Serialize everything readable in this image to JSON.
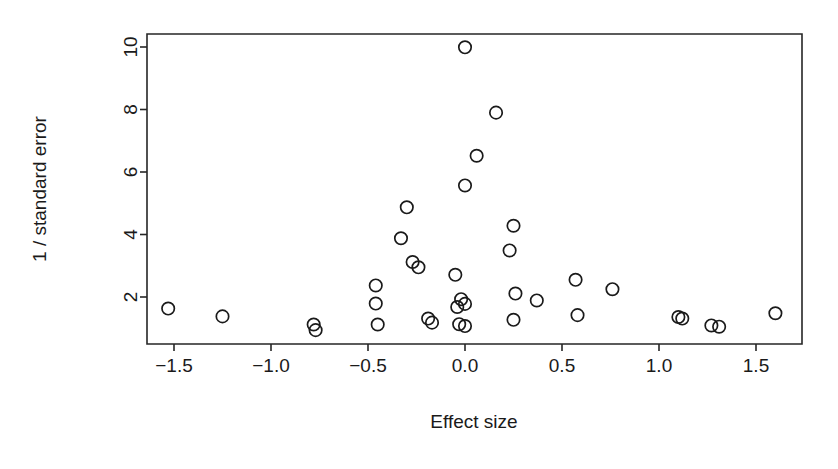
{
  "chart_data": {
    "type": "scatter",
    "title": "",
    "subtitle": "",
    "xlabel": "Effect size",
    "ylabel": "1 / standard error",
    "xlim": [
      -1.73,
      1.83
    ],
    "ylim": [
      0.72,
      10.55
    ],
    "grid": false,
    "legend": null,
    "xticks": [
      -1.5,
      -1.0,
      -0.5,
      0.0,
      0.5,
      1.0,
      1.5
    ],
    "xticklabels": [
      "-1.5",
      "-1.0",
      "-0.5",
      "0.0",
      "0.5",
      "1.0",
      "1.5"
    ],
    "yticks": [
      2,
      4,
      6,
      8,
      10
    ],
    "yticklabels": [
      "2",
      "4",
      "6",
      "8",
      "10"
    ],
    "marker": "open-circle",
    "marker_radius_px": 6.2,
    "point_color": "#1a1a1a",
    "points": [
      {
        "x": -1.53,
        "y": 1.63
      },
      {
        "x": -1.25,
        "y": 1.38
      },
      {
        "x": -0.78,
        "y": 1.12
      },
      {
        "x": -0.77,
        "y": 0.94
      },
      {
        "x": -0.46,
        "y": 2.37
      },
      {
        "x": -0.46,
        "y": 1.79
      },
      {
        "x": -0.45,
        "y": 1.12
      },
      {
        "x": -0.3,
        "y": 4.87
      },
      {
        "x": -0.33,
        "y": 3.88
      },
      {
        "x": -0.27,
        "y": 3.12
      },
      {
        "x": -0.24,
        "y": 2.95
      },
      {
        "x": -0.19,
        "y": 1.31
      },
      {
        "x": -0.17,
        "y": 1.18
      },
      {
        "x": -0.05,
        "y": 2.71
      },
      {
        "x": -0.02,
        "y": 1.93
      },
      {
        "x": -0.04,
        "y": 1.68
      },
      {
        "x": 0.0,
        "y": 1.78
      },
      {
        "x": -0.03,
        "y": 1.13
      },
      {
        "x": 0.0,
        "y": 1.07
      },
      {
        "x": 0.0,
        "y": 9.99
      },
      {
        "x": 0.16,
        "y": 7.9
      },
      {
        "x": 0.06,
        "y": 6.52
      },
      {
        "x": 0.0,
        "y": 5.57
      },
      {
        "x": 0.25,
        "y": 4.28
      },
      {
        "x": 0.23,
        "y": 3.49
      },
      {
        "x": 0.26,
        "y": 2.11
      },
      {
        "x": 0.37,
        "y": 1.89
      },
      {
        "x": 0.25,
        "y": 1.27
      },
      {
        "x": 0.57,
        "y": 2.55
      },
      {
        "x": 0.58,
        "y": 1.42
      },
      {
        "x": 0.76,
        "y": 2.25
      },
      {
        "x": 1.1,
        "y": 1.36
      },
      {
        "x": 1.12,
        "y": 1.31
      },
      {
        "x": 1.27,
        "y": 1.09
      },
      {
        "x": 1.31,
        "y": 1.05
      },
      {
        "x": 1.6,
        "y": 1.48
      }
    ]
  },
  "figure": {
    "background_color": "#ffffff",
    "axis_color": "#262626"
  }
}
